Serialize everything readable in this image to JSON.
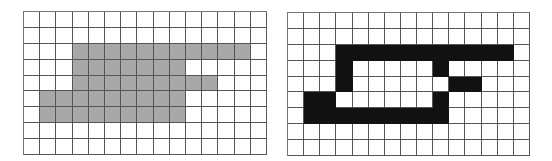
{
  "grids": [
    {
      "name": "left-grid",
      "rows": 9,
      "cols": 15,
      "fill_color": "#a8a8a8",
      "fill_class": "gray",
      "filled": [
        [
          2,
          3
        ],
        [
          2,
          4
        ],
        [
          2,
          5
        ],
        [
          2,
          6
        ],
        [
          2,
          7
        ],
        [
          2,
          8
        ],
        [
          2,
          9
        ],
        [
          2,
          10
        ],
        [
          2,
          11
        ],
        [
          2,
          12
        ],
        [
          2,
          13
        ],
        [
          3,
          3
        ],
        [
          3,
          4
        ],
        [
          3,
          5
        ],
        [
          3,
          6
        ],
        [
          3,
          7
        ],
        [
          3,
          8
        ],
        [
          3,
          9
        ],
        [
          4,
          3
        ],
        [
          4,
          4
        ],
        [
          4,
          5
        ],
        [
          4,
          6
        ],
        [
          4,
          7
        ],
        [
          4,
          8
        ],
        [
          4,
          9
        ],
        [
          4,
          10
        ],
        [
          4,
          11
        ],
        [
          5,
          1
        ],
        [
          5,
          2
        ],
        [
          5,
          3
        ],
        [
          5,
          4
        ],
        [
          5,
          5
        ],
        [
          5,
          6
        ],
        [
          5,
          7
        ],
        [
          5,
          8
        ],
        [
          5,
          9
        ],
        [
          6,
          1
        ],
        [
          6,
          2
        ],
        [
          6,
          3
        ],
        [
          6,
          4
        ],
        [
          6,
          5
        ],
        [
          6,
          6
        ],
        [
          6,
          7
        ],
        [
          6,
          8
        ],
        [
          6,
          9
        ]
      ]
    },
    {
      "name": "right-grid",
      "rows": 9,
      "cols": 15,
      "fill_color": "#111111",
      "fill_class": "black",
      "filled": [
        [
          2,
          3
        ],
        [
          2,
          4
        ],
        [
          2,
          5
        ],
        [
          2,
          6
        ],
        [
          2,
          7
        ],
        [
          2,
          8
        ],
        [
          2,
          9
        ],
        [
          2,
          10
        ],
        [
          2,
          11
        ],
        [
          2,
          12
        ],
        [
          2,
          13
        ],
        [
          3,
          3
        ],
        [
          3,
          9
        ],
        [
          4,
          3
        ],
        [
          4,
          10
        ],
        [
          4,
          11
        ],
        [
          5,
          1
        ],
        [
          5,
          2
        ],
        [
          5,
          9
        ],
        [
          6,
          1
        ],
        [
          6,
          2
        ],
        [
          6,
          3
        ],
        [
          6,
          4
        ],
        [
          6,
          5
        ],
        [
          6,
          6
        ],
        [
          6,
          7
        ],
        [
          6,
          8
        ],
        [
          6,
          9
        ]
      ]
    }
  ]
}
